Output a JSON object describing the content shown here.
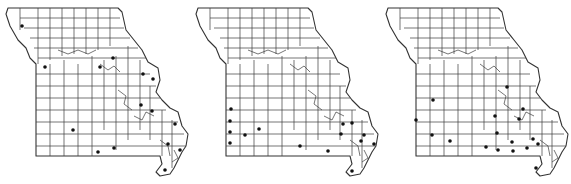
{
  "figure": {
    "panels": [
      {
        "id": "map-1",
        "offset_x": 0,
        "dot_color": "#111111",
        "dots": [
          [
            22,
            26
          ],
          [
            45,
            67
          ],
          [
            113,
            58
          ],
          [
            100,
            67
          ],
          [
            143,
            74
          ],
          [
            153,
            79
          ],
          [
            141,
            105
          ],
          [
            152,
            111
          ],
          [
            175,
            124
          ],
          [
            168,
            144
          ],
          [
            180,
            150
          ],
          [
            73,
            130
          ],
          [
            114,
            148
          ],
          [
            98,
            152
          ],
          [
            165,
            170
          ]
        ]
      },
      {
        "id": "map-2",
        "offset_x": 190,
        "dot_color": "#111111",
        "dots": [
          [
            231,
            109
          ],
          [
            230,
            121
          ],
          [
            230,
            132
          ],
          [
            230,
            143
          ],
          [
            245,
            135
          ],
          [
            259,
            129
          ],
          [
            300,
            146
          ],
          [
            328,
            151
          ],
          [
            341,
            134
          ],
          [
            343,
            124
          ],
          [
            352,
            123
          ],
          [
            364,
            135
          ],
          [
            361,
            141
          ],
          [
            374,
            144
          ],
          [
            352,
            171
          ]
        ]
      },
      {
        "id": "map-3",
        "offset_x": 380,
        "dot_color": "#111111",
        "dots": [
          [
            433,
            100
          ],
          [
            416,
            120
          ],
          [
            432,
            135
          ],
          [
            450,
            141
          ],
          [
            507,
            87
          ],
          [
            495,
            116
          ],
          [
            523,
            109
          ],
          [
            519,
            119
          ],
          [
            497,
            133
          ],
          [
            512,
            142
          ],
          [
            533,
            139
          ],
          [
            486,
            147
          ],
          [
            498,
            150
          ],
          [
            513,
            151
          ],
          [
            527,
            148
          ],
          [
            538,
            144
          ],
          [
            536,
            168
          ]
        ]
      }
    ],
    "line_color": "#333333",
    "background": "#ffffff"
  }
}
